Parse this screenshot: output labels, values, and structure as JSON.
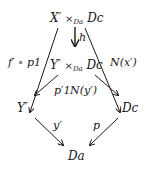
{
  "nodes": {
    "top": {
      "base": "X′",
      "times": "×",
      "sub": "Da",
      "right": "Dc"
    },
    "middle": {
      "base": "Y′",
      "times": "×",
      "sub": "Da",
      "right": "Dc"
    },
    "left": {
      "text": "Y′"
    },
    "right": {
      "text": "Dc"
    },
    "bottom": {
      "text": "Da"
    }
  },
  "arrows": {
    "h": "h",
    "f_p1": "f′ ∘ p1",
    "N_x": "N(x′)",
    "p1_prime": "p′1",
    "N_y": "N(y′)",
    "y_prime": "y′",
    "p": "p"
  },
  "colors": {
    "ink": "#1a1a1a",
    "background": "#ffffff"
  }
}
